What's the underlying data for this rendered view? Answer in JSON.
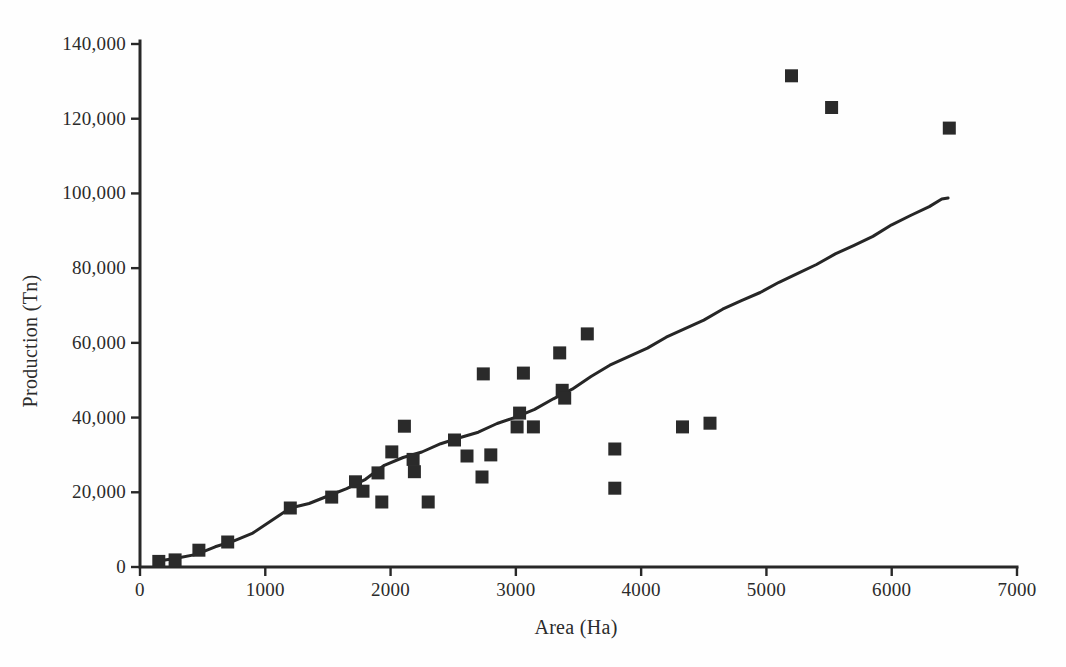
{
  "figure": {
    "background": "#fefefe",
    "ink_color": "#2b2b2b"
  },
  "chart_data": {
    "type": "scatter",
    "title": "",
    "xlabel": "Area (Ha)",
    "ylabel": "Production (Tn)",
    "xlim": [
      0,
      7000
    ],
    "ylim": [
      0,
      140000
    ],
    "grid": false,
    "legend": "none",
    "marker": "filled-square",
    "x_ticks": [
      {
        "value": 0,
        "label": "0"
      },
      {
        "value": 1000,
        "label": "1000"
      },
      {
        "value": 2000,
        "label": "2000"
      },
      {
        "value": 3000,
        "label": "3000"
      },
      {
        "value": 4000,
        "label": "4000"
      },
      {
        "value": 5000,
        "label": "5000"
      },
      {
        "value": 6000,
        "label": "6000"
      },
      {
        "value": 7000,
        "label": "7000"
      }
    ],
    "y_ticks": [
      {
        "value": 0,
        "label": "0"
      },
      {
        "value": 20000,
        "label": "20,000"
      },
      {
        "value": 40000,
        "label": "40,000"
      },
      {
        "value": 60000,
        "label": "60,000"
      },
      {
        "value": 80000,
        "label": "80,000"
      },
      {
        "value": 100000,
        "label": "100,000"
      },
      {
        "value": 120000,
        "label": "120,000"
      },
      {
        "value": 140000,
        "label": "140,000"
      }
    ],
    "series": [
      {
        "name": "observations",
        "kind": "scatter",
        "points": [
          [
            150,
            1500
          ],
          [
            280,
            1900
          ],
          [
            470,
            4500
          ],
          [
            700,
            6700
          ],
          [
            1200,
            15800
          ],
          [
            1530,
            18700
          ],
          [
            1720,
            22800
          ],
          [
            1780,
            20300
          ],
          [
            1900,
            25200
          ],
          [
            1930,
            17400
          ],
          [
            2010,
            30800
          ],
          [
            2110,
            37700
          ],
          [
            2180,
            28800
          ],
          [
            2190,
            25500
          ],
          [
            2300,
            17400
          ],
          [
            2510,
            34000
          ],
          [
            2610,
            29700
          ],
          [
            2730,
            24100
          ],
          [
            2740,
            51700
          ],
          [
            2800,
            30000
          ],
          [
            3010,
            37500
          ],
          [
            3030,
            41200
          ],
          [
            3060,
            51900
          ],
          [
            3140,
            37500
          ],
          [
            3350,
            57300
          ],
          [
            3370,
            47300
          ],
          [
            3390,
            45200
          ],
          [
            3570,
            62400
          ],
          [
            3790,
            31600
          ],
          [
            3790,
            21100
          ],
          [
            4330,
            37500
          ],
          [
            4550,
            38500
          ],
          [
            5200,
            131500
          ],
          [
            5520,
            123000
          ],
          [
            6460,
            117500
          ]
        ]
      },
      {
        "name": "trend-line",
        "kind": "line",
        "points": [
          [
            150,
            1400
          ],
          [
            300,
            2400
          ],
          [
            450,
            3600
          ],
          [
            600,
            5200
          ],
          [
            750,
            7000
          ],
          [
            900,
            9300
          ],
          [
            1050,
            12200
          ],
          [
            1200,
            15800
          ],
          [
            1350,
            17200
          ],
          [
            1500,
            18800
          ],
          [
            1650,
            21000
          ],
          [
            1800,
            23700
          ],
          [
            1950,
            27000
          ],
          [
            2100,
            29300
          ],
          [
            2250,
            31000
          ],
          [
            2400,
            32800
          ],
          [
            2550,
            34600
          ],
          [
            2700,
            36300
          ],
          [
            2850,
            38200
          ],
          [
            3000,
            40100
          ],
          [
            3150,
            42400
          ],
          [
            3300,
            44800
          ],
          [
            3450,
            47600
          ],
          [
            3600,
            51200
          ],
          [
            3750,
            53800
          ],
          [
            3900,
            56300
          ],
          [
            4050,
            58800
          ],
          [
            4200,
            61300
          ],
          [
            4350,
            63800
          ],
          [
            4500,
            66300
          ],
          [
            4650,
            68800
          ],
          [
            4800,
            71300
          ],
          [
            4950,
            73700
          ],
          [
            5100,
            76000
          ],
          [
            5250,
            78600
          ],
          [
            5400,
            81200
          ],
          [
            5550,
            83600
          ],
          [
            5700,
            86100
          ],
          [
            5850,
            88700
          ],
          [
            6000,
            91400
          ],
          [
            6150,
            94100
          ],
          [
            6300,
            96700
          ],
          [
            6400,
            98300
          ],
          [
            6450,
            98800
          ]
        ]
      }
    ]
  }
}
